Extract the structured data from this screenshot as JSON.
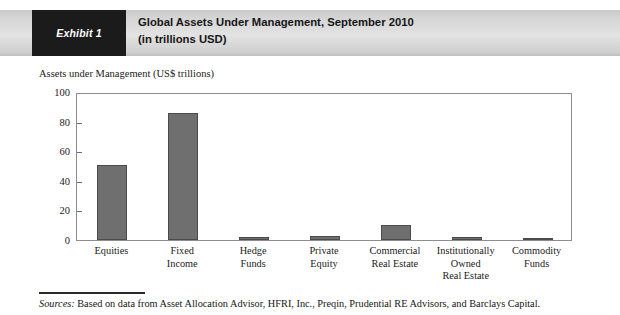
{
  "header": {
    "tag": "Exhibit 1",
    "title_line1": "Global Assets Under Management, September 2010",
    "title_line2": "(in trillions USD)",
    "tag_background": "#1b1b1b",
    "banner_background": "#dcdcdc"
  },
  "footer": {
    "source_label": "Sources:",
    "source_text": " Based on data from Asset Allocation Advisor, HFRI, Inc., Preqin, Prudential RE Advisors, and Barclays Capital."
  },
  "chart_data": {
    "type": "bar",
    "title": "Global Assets Under Management, September 2010",
    "subtitle": "(in trillions USD)",
    "ylabel": "Assets under Management (US$ trillions)",
    "xlabel": "",
    "ylim": [
      0,
      100
    ],
    "yticks": [
      0,
      20,
      40,
      60,
      80,
      100
    ],
    "ytick_labels": [
      "0",
      "20",
      "40",
      "60",
      "80",
      "100"
    ],
    "grid": false,
    "legend": false,
    "bar_color": "#6f6f6f",
    "bar_edge_color": "#4b4b4b",
    "categories": [
      "Equities",
      "Fixed Income",
      "Hedge Funds",
      "Private Equity",
      "Commercial Real Estate",
      "Institutionally Owned Real Estate",
      "Commodity Funds"
    ],
    "category_label_lines": [
      [
        "Equities"
      ],
      [
        "Fixed",
        "Income"
      ],
      [
        "Hedge",
        "Funds"
      ],
      [
        "Private",
        "Equity"
      ],
      [
        "Commercial",
        "Real Estate"
      ],
      [
        "Institutionally",
        "Owned",
        "Real Estate"
      ],
      [
        "Commodity",
        "Funds"
      ]
    ],
    "values": [
      51,
      86,
      1.7,
      2.5,
      10,
      1.7,
      0.6
    ]
  }
}
